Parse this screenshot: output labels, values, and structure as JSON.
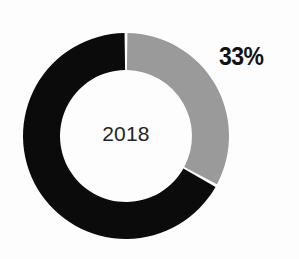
{
  "chart_data": {
    "type": "pie",
    "variant": "donut",
    "title": "",
    "subtitle": "",
    "center_label": "2018",
    "categories": [
      "Share",
      "Remainder"
    ],
    "values": [
      33,
      67
    ],
    "value_unit": "%",
    "labels": [
      "33%",
      ""
    ],
    "colors": [
      "#9a9a9a",
      "#0b0b0b"
    ],
    "series": [
      {
        "name": "2018",
        "values": [
          33,
          67
        ]
      }
    ],
    "slices": [
      {
        "name": "Share",
        "value": 33,
        "label": "33%",
        "color": "#9a9a9a",
        "start_angle": 0,
        "end_angle": 118.8,
        "label_shown": true
      },
      {
        "name": "Remainder",
        "value": 67,
        "label": "",
        "color": "#0b0b0b",
        "start_angle": 118.8,
        "end_angle": 360,
        "label_shown": false
      }
    ],
    "legend": [],
    "legend_position": "none",
    "grid": false,
    "xlabel": "",
    "ylabel": ""
  },
  "geometry": {
    "cx": 126,
    "cy": 136,
    "outer_radius": 103,
    "inner_radius": 66,
    "gap_degrees": 1.6,
    "start_offset_degrees": 0
  },
  "colors": {
    "background": "#fdfdfd",
    "slice_gray": "#9a9a9a",
    "slice_black": "#0b0b0b",
    "center_text": "#242424",
    "pct_text": "#121212"
  },
  "annotations": {
    "percent_label": "33%",
    "year_label": "2018"
  }
}
